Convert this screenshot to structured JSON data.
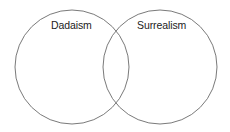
{
  "diagram": {
    "type": "venn",
    "sets": [
      {
        "label": "Dadaism",
        "cx": 72,
        "cy": 67,
        "r": 57
      },
      {
        "label": "Surrealism",
        "cx": 160,
        "cy": 67,
        "r": 57
      }
    ],
    "stroke_color": "#7a7a7a"
  }
}
